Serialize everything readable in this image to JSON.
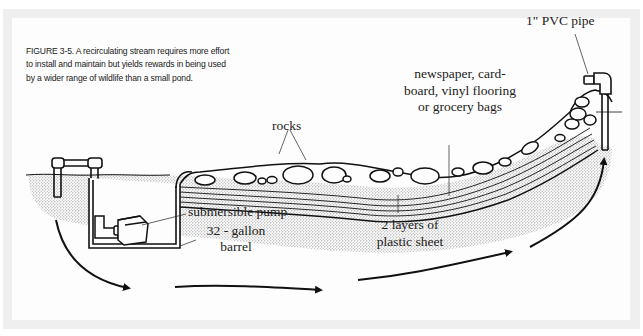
{
  "figure": {
    "number": "FIGURE 3-5.",
    "caption_text": "A recirculating stream requires more effort to install and maintain but yields rewards in being used by a wider range of wildlife than a small pond.",
    "caption_lines": [
      "FIGURE 3-5. A recirculating stream requires more effort",
      "to install and maintain but yields rewards in being used",
      "by a wider range of wildlife than a small pond."
    ]
  },
  "labels": {
    "pvc_pipe": "1\" PVC pipe",
    "liner_line1": "newspaper, card-",
    "liner_line2": "board, vinyl flooring",
    "liner_line3": "or grocery bags",
    "rocks": "rocks",
    "pump": "submersible pump",
    "barrel_line1": "32 - gallon",
    "barrel_line2": "barrel",
    "plastic_line1": "2 layers of",
    "plastic_line2": "plastic sheet"
  },
  "colors": {
    "frame": "#efefef",
    "panel": "#fdfdfd",
    "ink": "#111111",
    "soil_dot": "#8a8a8a"
  }
}
